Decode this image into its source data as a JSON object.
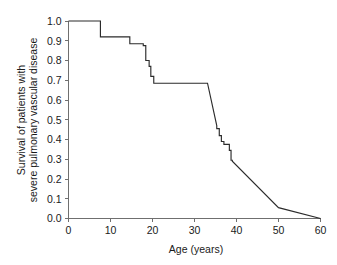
{
  "chart_data": {
    "type": "line",
    "subtype": "kaplan-meier-step-survival",
    "title": "",
    "xlabel": "Age (years)",
    "ylabel_lines": [
      "Survival of patients with",
      "severe pulmonary vascular disease"
    ],
    "ylabel": "Survival of patients with severe pulmonary vascular disease",
    "xlim": [
      0,
      60
    ],
    "ylim": [
      0.0,
      1.0
    ],
    "xticks": [
      0,
      10,
      20,
      30,
      40,
      50,
      60
    ],
    "xtick_labels": [
      "0",
      "10",
      "20",
      "30",
      "40",
      "50",
      "60"
    ],
    "yticks": [
      0.0,
      0.1,
      0.2,
      0.3,
      0.4,
      0.5,
      0.6,
      0.7,
      0.8,
      0.9,
      1.0
    ],
    "ytick_labels": [
      "0.0",
      "0.1",
      "0.2",
      "0.3",
      "0.4",
      "0.5",
      "0.6",
      "0.7",
      "0.8",
      "0.9",
      "1.0"
    ],
    "grid": false,
    "legend": null,
    "legend_position": "none",
    "line_color": "#2b2b2b",
    "axis_color": "#6f6f6f",
    "background_color": "#ffffff",
    "series": [
      {
        "name": "Survival of patients with severe pulmonary vascular disease",
        "x": [
          0.0,
          7.6,
          7.6,
          14.6,
          14.6,
          17.8,
          17.8,
          18.4,
          18.4,
          19.2,
          19.2,
          19.6,
          19.6,
          20.3,
          20.3,
          33.1,
          33.1,
          35.3,
          35.3,
          35.9,
          35.9,
          36.4,
          36.4,
          37.0,
          37.0,
          38.3,
          38.3,
          38.7,
          38.7,
          39.0,
          39.0,
          50.0,
          60.0
        ],
        "y": [
          1.0,
          1.0,
          0.92,
          0.92,
          0.885,
          0.885,
          0.875,
          0.875,
          0.8,
          0.8,
          0.77,
          0.77,
          0.72,
          0.72,
          0.685,
          0.685,
          0.685,
          0.47,
          0.455,
          0.455,
          0.42,
          0.42,
          0.39,
          0.39,
          0.375,
          0.375,
          0.345,
          0.345,
          0.295,
          0.295,
          0.29,
          0.055,
          0.0
        ]
      }
    ],
    "annotations": [],
    "notable_points": [
      {
        "age": 0,
        "survival": 1.0,
        "note": "start of follow-up"
      },
      {
        "age": 7.6,
        "survival": 0.92,
        "note": "first event drop"
      },
      {
        "age": 14.6,
        "survival": 0.885,
        "note": "second event drop"
      },
      {
        "age": 20.3,
        "survival": 0.685,
        "note": "plateau begins after steep decline"
      },
      {
        "age": 33.1,
        "survival": 0.685,
        "note": "plateau ends"
      },
      {
        "age": 39.0,
        "survival": 0.29,
        "note": "end of staircase decline"
      },
      {
        "age": 50.0,
        "survival": 0.055,
        "note": "late tail"
      },
      {
        "age": 60.0,
        "survival": 0.0,
        "note": "end of follow-up"
      }
    ]
  },
  "figure": {
    "caption": ""
  }
}
